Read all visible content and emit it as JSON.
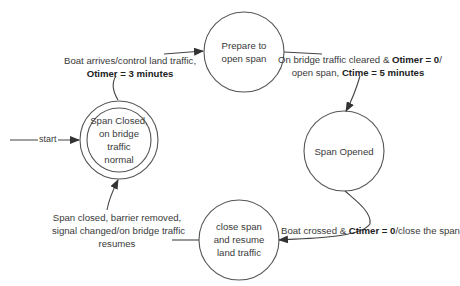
{
  "states": [
    {
      "id": "span-closed",
      "label": "Span Closed, on bridge traffic normal",
      "lines": [
        "Span Closed,",
        "on bridge",
        "traffic",
        "normal"
      ],
      "type": "initial-double"
    },
    {
      "id": "prepare-to-open",
      "label": "Prepare to open span",
      "lines": [
        "Prepare to",
        "open span"
      ]
    },
    {
      "id": "span-opened",
      "label": "Span Opened",
      "lines": [
        "Span Opened"
      ]
    },
    {
      "id": "close-span",
      "label": "close span and resume land traffic",
      "lines": [
        "close span",
        "and resume",
        "land traffic"
      ]
    }
  ],
  "start_label": "start",
  "transitions": [
    {
      "from": "span-closed",
      "to": "prepare-to-open",
      "line1": "Boat arrives/control land traffic,",
      "line2_bold": "Otimer = 3 minutes"
    },
    {
      "from": "prepare-to-open",
      "to": "span-opened",
      "line1_pre": "On bridge traffic cleared & ",
      "line1_bold": "Otimer = 0",
      "line1_post": "/",
      "line2_pre": "open span, ",
      "line2_bold": "Ctime = 5 minutes"
    },
    {
      "from": "span-opened",
      "to": "close-span",
      "pre": "Boat crossed & ",
      "bold": "Ctimer = 0",
      "post": "/close the span"
    },
    {
      "from": "close-span",
      "to": "span-closed",
      "lines": [
        "Span closed, barrier removed,",
        "signal changed/on bridge traffic",
        "resumes"
      ]
    }
  ]
}
